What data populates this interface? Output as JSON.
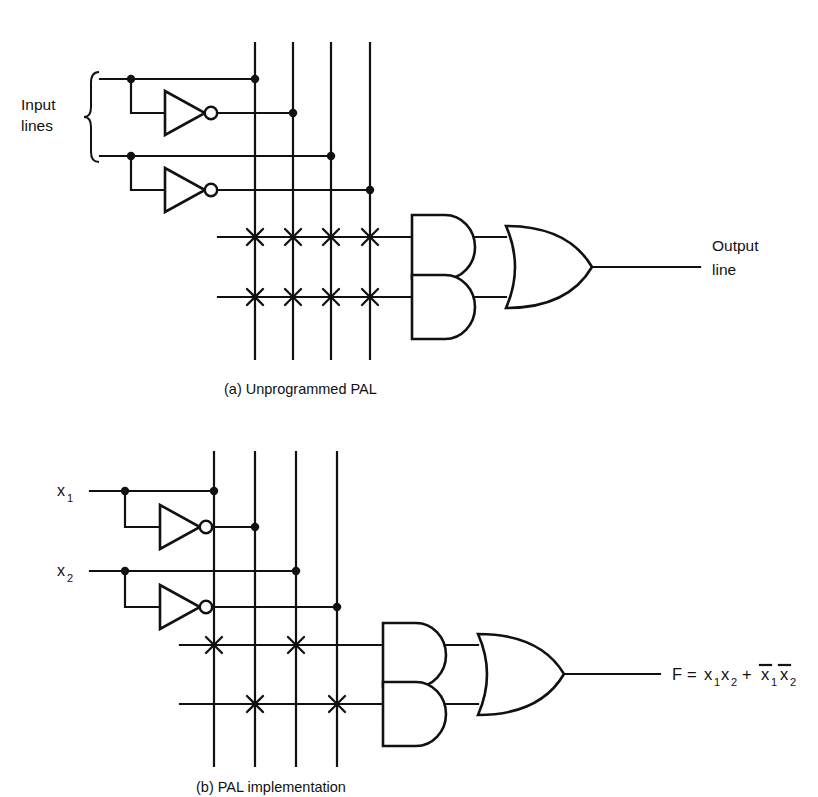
{
  "figure": {
    "page_top_fragment": "",
    "panels": [
      {
        "id": "panel-a",
        "caption": "(a)  Unprogrammed PAL",
        "input_group_label_line1": "Input",
        "input_group_label_line2": "lines",
        "output_label_line1": "Output",
        "output_label_line2": "line",
        "input_line_labels": [],
        "column_count": 4,
        "product_line_count": 2,
        "fuse_matrix": [
          [
            true,
            true,
            true,
            true
          ],
          [
            true,
            true,
            true,
            true
          ]
        ],
        "gates": {
          "and_count": 2,
          "or_count": 1,
          "inverter_count": 2
        }
      },
      {
        "id": "panel-b",
        "caption": "(b)  PAL implementation",
        "input_group_label_line1": "",
        "input_group_label_line2": "",
        "output_expression": "F = x₁x₂ + x̄1x̄2",
        "output_expression_parts": {
          "f": "F",
          "equals": "=",
          "term1_var1": "x",
          "term1_sub1": "1",
          "term1_var2": "x",
          "term1_sub2": "2",
          "plus": "+",
          "term2_var1": "x",
          "term2_sub1": "1",
          "term2_var2": "x",
          "term2_sub2": "2"
        },
        "input_line_labels": [
          {
            "name": "x",
            "sub": "1"
          },
          {
            "name": "x",
            "sub": "2"
          }
        ],
        "column_count": 4,
        "product_line_count": 2,
        "fuse_matrix": [
          [
            true,
            false,
            true,
            false
          ],
          [
            false,
            true,
            false,
            true
          ]
        ],
        "gates": {
          "and_count": 2,
          "or_count": 1,
          "inverter_count": 2
        }
      }
    ],
    "colors": {
      "ink": "#111111",
      "paper": "#ffffff"
    }
  }
}
